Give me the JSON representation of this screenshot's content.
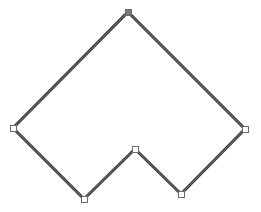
{
  "canvas": {
    "width": 261,
    "height": 212,
    "background": "#ffffff"
  },
  "shape": {
    "type": "polygon",
    "stroke_color": "#3a3a3a",
    "inner_stroke_color": "#8a8a8a",
    "fill": "none",
    "vertices": [
      {
        "x": 128,
        "y": 12,
        "selected": true
      },
      {
        "x": 245,
        "y": 129,
        "selected": false
      },
      {
        "x": 181,
        "y": 194,
        "selected": false
      },
      {
        "x": 135,
        "y": 149,
        "selected": false
      },
      {
        "x": 84,
        "y": 199,
        "selected": false
      },
      {
        "x": 13,
        "y": 128,
        "selected": false
      }
    ]
  },
  "handles": {
    "size": 6,
    "fill": "#ffffff",
    "stroke": "#6a6a6a",
    "selected_fill": "#7a7a7a"
  }
}
